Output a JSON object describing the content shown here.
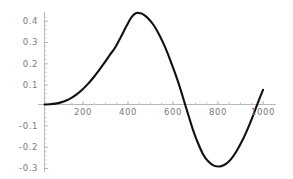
{
  "chart_data": {
    "type": "line",
    "title": "",
    "subtitle": "",
    "xlabel": "",
    "ylabel": "",
    "xlim": [
      0,
      1000
    ],
    "ylim": [
      -0.32,
      0.45
    ],
    "grid": false,
    "legend": null,
    "legend_position": "none",
    "axis_style": "crossing-axes-at-zero",
    "x_ticks": [
      200,
      400,
      600,
      800,
      1000
    ],
    "x_tick_labels": [
      "200",
      "400",
      "600",
      "800",
      "1000"
    ],
    "y_ticks": [
      0.4,
      0.3,
      0.2,
      0.1,
      -0.1,
      -0.2,
      -0.3
    ],
    "y_tick_labels": [
      "0.4",
      "0.3",
      "0.2",
      "0.1",
      "-0.1",
      "-0.2",
      "-0.3"
    ],
    "minor_ticks": true,
    "series": [
      {
        "name": "curve",
        "color": "#111111",
        "line_width": 2.1,
        "x": [
          0,
          25,
          50,
          75,
          100,
          125,
          150,
          175,
          200,
          225,
          250,
          275,
          300,
          325,
          350,
          375,
          400,
          420,
          440,
          460,
          480,
          500,
          525,
          550,
          575,
          600,
          620,
          640,
          660,
          680,
          700,
          725,
          750,
          775,
          800,
          820,
          840,
          860,
          880,
          900,
          925,
          950,
          975,
          1000
        ],
        "y": [
          0.0,
          0.001,
          0.004,
          0.01,
          0.019,
          0.032,
          0.05,
          0.072,
          0.098,
          0.128,
          0.161,
          0.197,
          0.234,
          0.27,
          0.318,
          0.368,
          0.412,
          0.43,
          0.428,
          0.417,
          0.398,
          0.372,
          0.328,
          0.274,
          0.21,
          0.14,
          0.079,
          0.012,
          -0.055,
          -0.12,
          -0.175,
          -0.232,
          -0.268,
          -0.287,
          -0.291,
          -0.285,
          -0.271,
          -0.248,
          -0.217,
          -0.18,
          -0.126,
          -0.064,
          0.004,
          0.069
        ]
      }
    ],
    "annotations": [],
    "notes": {
      "zero_crossing_rising": 0,
      "peak_x": 420,
      "peak_y": 0.43,
      "zero_crossing_falling": 645,
      "trough_x": 800,
      "trough_y": -0.29,
      "end_y": 0.07
    }
  },
  "axes": {
    "axis_color": "#b5b5b5",
    "tick_color": "#b0b0b0",
    "label_color": "#7a7a7a",
    "curve_color": "#111111",
    "background": "#ffffff"
  }
}
